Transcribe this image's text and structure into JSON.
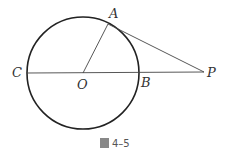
{
  "figure": {
    "caption": "圖 4–5",
    "caption_char": "圖",
    "caption_num": "4–5"
  },
  "points": {
    "A": {
      "label": "A",
      "x": 108,
      "y": 24
    },
    "B": {
      "label": "B",
      "x": 139,
      "y": 73
    },
    "C": {
      "label": "C",
      "x": 27,
      "y": 73
    },
    "O": {
      "label": "O",
      "x": 83,
      "y": 73
    },
    "P": {
      "label": "P",
      "x": 204,
      "y": 72
    }
  },
  "circle": {
    "cx": 83,
    "cy": 73,
    "r": 56
  },
  "colors": {
    "stroke": "#222222",
    "thin": "#444444"
  }
}
